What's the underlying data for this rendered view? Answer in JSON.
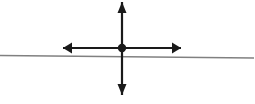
{
  "canvas": {
    "width": 255,
    "height": 104,
    "background_color": "#ffffff",
    "title": "point-with-crossing-axes-and-line"
  },
  "colors": {
    "stroke_dark": "#1a1a1a",
    "stroke_gray": "#808080",
    "background": "#ffffff"
  },
  "figure": {
    "center_point": {
      "name": "intersection-point",
      "x": 122,
      "y": 48,
      "radius": 4.2,
      "fill": "#1a1a1a"
    },
    "vertical_arrow": {
      "name": "vertical-double-arrow",
      "x": 122,
      "y_top": 2,
      "y_bottom": 95,
      "shaft_width": 2.2,
      "arrowhead_width": 9,
      "arrowhead_length": 11,
      "heads": "both",
      "color": "#1a1a1a"
    },
    "horizontal_arrow": {
      "name": "horizontal-double-arrow",
      "y": 48,
      "x_left": 63,
      "x_right": 181,
      "shaft_width": 2.2,
      "arrowhead_width": 11,
      "arrowhead_length": 9,
      "heads": "both",
      "color": "#1a1a1a"
    },
    "gray_line": {
      "name": "horizontal-gray-line",
      "x_start": 0,
      "y_start": 55.5,
      "x_end": 254,
      "y_end": 58,
      "width": 1.6,
      "color": "#808080"
    }
  }
}
